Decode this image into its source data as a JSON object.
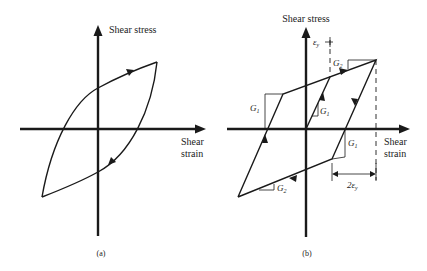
{
  "figure": {
    "panel_a": {
      "caption": "(a)",
      "y_axis_label": "Shear stress",
      "x_axis_label_line1": "Shear",
      "x_axis_label_line2": "strain",
      "description": "Curved hysteresis loop (smooth elastic-plastic shear stress-strain cycle)"
    },
    "panel_b": {
      "caption": "(b)",
      "y_axis_label": "Shear stress",
      "x_axis_label_line1": "Shear",
      "x_axis_label_line2": "strain",
      "description": "Bilinear hysteresis loop with elastic slope G1 and post-yield slope G2",
      "labels": {
        "yield_strain": "ε",
        "yield_strain_sub": "y",
        "slope_g2_top": "G",
        "slope_g2_top_sub": "2",
        "slope_g1_inner": "G",
        "slope_g1_inner_sub": "1",
        "slope_g1_left": "G",
        "slope_g1_left_sub": "1",
        "slope_g1_right": "G",
        "slope_g1_right_sub": "1",
        "slope_g2_bottom": "G",
        "slope_g2_bottom_sub": "2",
        "double_yield": "2ε",
        "double_yield_sub": "y"
      }
    },
    "colors": {
      "stroke": "#1a1a1a",
      "background": "#ffffff"
    }
  }
}
